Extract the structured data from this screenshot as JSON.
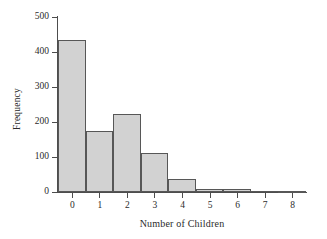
{
  "chart_data": {
    "type": "bar",
    "title": "",
    "subtitle": "",
    "xlabel": "Number of Children",
    "ylabel": "Frequency",
    "categories": [
      "0",
      "1",
      "2",
      "3",
      "4",
      "5",
      "6",
      "7",
      "8"
    ],
    "values": [
      435,
      175,
      222,
      111,
      37,
      10,
      9,
      0,
      3
    ],
    "xlim": [
      -0.5,
      8.5
    ],
    "ylim": [
      0,
      500
    ],
    "yticks": [
      0,
      100,
      200,
      300,
      400,
      500
    ],
    "ytick_labels": [
      "0",
      "100",
      "200",
      "300",
      "400",
      "500"
    ],
    "xticks": [
      0,
      1,
      2,
      3,
      4,
      5,
      6,
      7,
      8
    ],
    "xtick_labels": [
      "0",
      "1",
      "2",
      "3",
      "4",
      "5",
      "6",
      "7",
      "8"
    ],
    "grid": false,
    "legend": null,
    "annotations": [],
    "bar_fill_color": "#d2d2d2",
    "bar_edge_color": "#575757",
    "axis_color": "#4d4d4d",
    "background_color": "#ffffff",
    "text_color": "#2b2b2b"
  }
}
